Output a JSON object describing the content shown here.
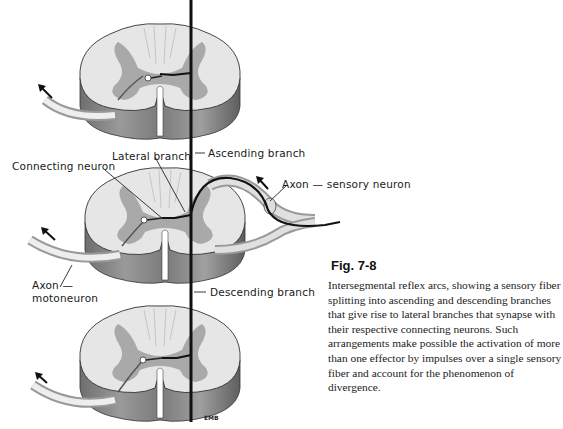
{
  "figure": {
    "number": "Fig. 7-8",
    "caption": "Intersegmental reflex arcs, showing a sensory fiber splitting into ascending and descending branches that give rise to lateral branches that synapse with their respective connecting neurons. Such arrangements make possible the activation of more than one effector by impulses over a single sensory fiber and account for the phenomenon of divergence.",
    "artist_signature": "EMB"
  },
  "labels": {
    "ascending_branch": "Ascending branch",
    "lateral_branch": "Lateral branch",
    "connecting_neuron": "Connecting neuron",
    "axon_sensory": "Axon — sensory neuron",
    "axon_moto_line1": "Axon —",
    "axon_moto_line2": "motoneuron",
    "descending_branch": "Descending branch"
  },
  "colors": {
    "white_matter": "#e6e6e6",
    "gray_matter": "#a9a9a9",
    "side_shade": "#8a8a8a",
    "fiber": "#111111"
  }
}
